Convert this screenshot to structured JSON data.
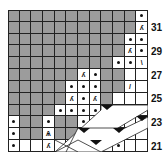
{
  "grid": {
    "cols": 12,
    "rows": 12,
    "cell_w": 11.67,
    "cell_h": 11.83
  },
  "colors": {
    "no_stitch": "#9c9c9c",
    "stitch": "#ffffff",
    "line": "#222222",
    "ink": "#111111"
  },
  "legend_symbols": {
    "dot": "purl",
    "k2tog": "⁄",
    "ssk": "∖",
    "slash": "/",
    "backslash": "\\",
    "cdd": "⋀"
  },
  "row_labels": [
    {
      "row": 1,
      "label": "31"
    },
    {
      "row": 3,
      "label": "29"
    },
    {
      "row": 5,
      "label": "27"
    },
    {
      "row": 7,
      "label": "25"
    },
    {
      "row": 9,
      "label": "23"
    },
    {
      "row": 11,
      "label": "21"
    }
  ],
  "rows": [
    [
      "g",
      "g",
      "g",
      "g",
      "g",
      "g",
      "g",
      "g",
      "g",
      "g",
      "g",
      "dot"
    ],
    [
      "g",
      "g",
      "g",
      "g",
      "g",
      "g",
      "g",
      "g",
      "g",
      "g",
      "g",
      "k2tog"
    ],
    [
      "g",
      "g",
      "g",
      "g",
      "g",
      "g",
      "g",
      "g",
      "g",
      "g",
      "dot",
      "dot"
    ],
    [
      "g",
      "g",
      "g",
      "g",
      "g",
      "g",
      "g",
      "g",
      "g",
      "g",
      "k2tog",
      "dot"
    ],
    [
      "g",
      "g",
      "g",
      "g",
      "g",
      "g",
      "g",
      "g",
      "g",
      "dot",
      "dot",
      "bslash"
    ],
    [
      "g",
      "g",
      "g",
      "g",
      "g",
      "g",
      "k2tog",
      "dot",
      "g",
      "g",
      "w",
      "w"
    ],
    [
      "g",
      "g",
      "g",
      "g",
      "g",
      "dot",
      "dot",
      "dot",
      "g",
      "g",
      "slash",
      "w"
    ],
    [
      "g",
      "g",
      "g",
      "g",
      "g",
      "k2tog",
      "dot",
      "ssk",
      "g",
      "w",
      "w",
      "w"
    ],
    [
      "g",
      "g",
      "g",
      "g",
      "dot",
      "dot",
      "dot",
      "dot",
      "w",
      "w",
      "w",
      "w"
    ],
    [
      "dot",
      "g",
      "g",
      "dot",
      "g",
      "g",
      "dot",
      "w",
      "w",
      "w",
      "w",
      "w"
    ],
    [
      "dot",
      "g",
      "g",
      "cdd",
      "g",
      "g",
      "w",
      "w",
      "w",
      "dot",
      "w",
      "w"
    ],
    [
      "dot",
      "w",
      "w",
      "k2tog",
      "w",
      "w",
      "w",
      "w",
      "dot",
      "dot",
      "w",
      "w"
    ]
  ]
}
